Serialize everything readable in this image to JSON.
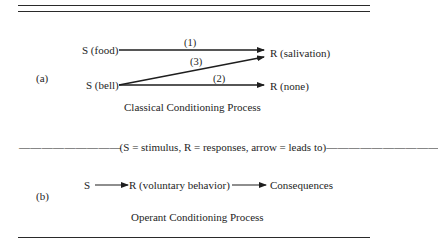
{
  "figure": {
    "panel_a": {
      "label": "(a)",
      "stimulus_food": "S (food)",
      "stimulus_bell": "S (bell)",
      "response_salivation": "R (salivation)",
      "response_none": "R (none)",
      "arrows": [
        {
          "label": "(1)",
          "from": "S (food)",
          "to": "R (salivation)"
        },
        {
          "label": "(2)",
          "from": "S (bell)",
          "to": "R (none)"
        },
        {
          "label": "(3)",
          "from": "S (bell)",
          "to": "R (salivation)"
        }
      ],
      "caption": "Classical Conditioning Process"
    },
    "legend": {
      "dashes_left": "— — — — — — — — —",
      "text": "(S = stimulus, R = responses, arrow = leads to)",
      "dashes_right": "— — — — — — — — — —"
    },
    "panel_b": {
      "label": "(b)",
      "stimulus": "S",
      "response": "R (voluntary behavior)",
      "outcome": "Consequences",
      "caption": "Operant Conditioning Process"
    },
    "colors": {
      "ink": "#1e1e1e",
      "background": "#ffffff"
    }
  }
}
